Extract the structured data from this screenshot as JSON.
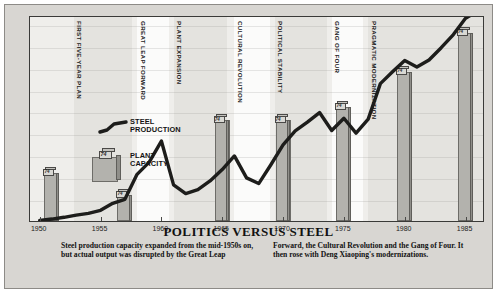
{
  "chart_data": {
    "type": "bar",
    "title": "POLITICS VERSUS STEEL",
    "xlabel": "",
    "ylabel": "millions of tons",
    "ylim": [
      0,
      47
    ],
    "xlim": [
      1949.2,
      1986.6
    ],
    "grid": false,
    "legend_position": "inside-upper-left",
    "y_ticks": [
      45,
      40,
      35,
      30,
      25,
      20,
      15,
      10,
      5
    ],
    "x_ticks": [
      1950,
      1955,
      1960,
      1965,
      1970,
      1975,
      1980,
      1985
    ],
    "series": [
      {
        "name": "PLANT CAPACITY",
        "type": "bar",
        "marker": "crate",
        "x": [
          1951,
          1957,
          1965,
          1970,
          1975,
          1980,
          1985
        ],
        "values": [
          11,
          6,
          23,
          23,
          26,
          34,
          43
        ]
      },
      {
        "name": "STEEL PRODUCTION",
        "type": "line",
        "x": [
          1950,
          1951,
          1952,
          1953,
          1954,
          1955,
          1956,
          1957,
          1958,
          1959,
          1960,
          1961,
          1962,
          1963,
          1964,
          1965,
          1966,
          1967,
          1968,
          1969,
          1970,
          1971,
          1972,
          1973,
          1974,
          1975,
          1976,
          1977,
          1978,
          1979,
          1980,
          1981,
          1982,
          1983,
          1984,
          1985,
          1986
        ],
        "values": [
          0.6,
          0.9,
          1.3,
          1.8,
          2.2,
          2.9,
          4.5,
          5.4,
          11.1,
          13.9,
          18.7,
          8.7,
          6.7,
          7.6,
          9.6,
          12.2,
          15.3,
          10.3,
          9.0,
          13.3,
          17.8,
          21.0,
          23.0,
          25.2,
          21.1,
          23.9,
          20.5,
          23.7,
          31.8,
          34.5,
          37.1,
          35.6,
          37.2,
          40.0,
          43.0,
          46.7,
          52.0
        ]
      }
    ],
    "annotations": [
      {
        "label": "FIRST FIVE-YEAR PLAN",
        "start": 1952.8,
        "end": 1957.6
      },
      {
        "label": "GREAT LEAP FORWARD",
        "start": 1958.0,
        "end": 1960.6
      },
      {
        "label": "PLANT EXPANSION",
        "start": 1961.0,
        "end": 1965.4
      },
      {
        "label": "CULTURAL REVOLUTION",
        "start": 1966.0,
        "end": 1968.9
      },
      {
        "label": "POLITICAL STABILITY",
        "start": 1969.3,
        "end": 1973.6
      },
      {
        "label": "GANG OF FOUR",
        "start": 1974.0,
        "end": 1976.6
      },
      {
        "label": "PRAGMATIC MODERNIZATION",
        "start": 1977.0,
        "end": 1986.4
      }
    ],
    "crate_label": "74"
  },
  "legend": {
    "steel_production": "STEEL\nPRODUCTION",
    "steel_production_line1": "STEEL",
    "steel_production_line2": "PRODUCTION",
    "plant_capacity_line1": "PLANT",
    "plant_capacity_line2": "CAPACITY"
  },
  "axis": {
    "y_title_line1": "millions",
    "y_title_line2": "of tons"
  },
  "caption": {
    "col1": "Steel production capacity expanded from the mid-1950s on, but actual output was disrupted by the Great Leap",
    "col2": "Forward, the Cultural Revolution and the Gang of Four. It then rose with Deng Xiaoping's modernizations."
  },
  "colors": {
    "card_background": "#d8d6d2",
    "plot_background": "#efeeeb",
    "band_light": "#fbfbfa",
    "band_shade": "#e4e3df",
    "bar_face": "#b3b2ad",
    "bar_side": "#908f8a",
    "line": "#1d1d1b",
    "frame": "#3a3a38",
    "text": "#1c1c1c"
  }
}
